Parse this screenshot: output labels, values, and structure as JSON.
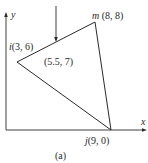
{
  "figure": {
    "caption": "(a)",
    "axes": {
      "x_label": "x",
      "y_label": "y"
    },
    "nodes": {
      "i": {
        "name": "i",
        "coords": "(3, 6)"
      },
      "j": {
        "name": "j",
        "coords": "(9, 0)"
      },
      "m": {
        "name": "m",
        "coords": "(8, 8)"
      }
    },
    "load_point": {
      "coords": "(5.5, 7)"
    },
    "colors": {
      "line": "#2a2a2a",
      "background": "#ffffff"
    }
  }
}
